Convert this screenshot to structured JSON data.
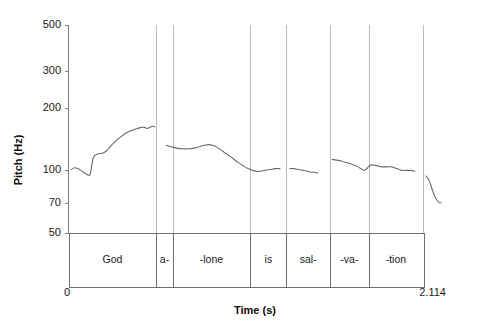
{
  "chart_data": {
    "type": "line",
    "title": "",
    "subtitle": "",
    "xlabel": "Time (s)",
    "ylabel": "Pitch (Hz)",
    "xlim": [
      0,
      2.114
    ],
    "ylim": [
      50,
      500
    ],
    "yscale": "log",
    "xtick_labels": [
      "0",
      "2.114"
    ],
    "ytick_labels": [
      "500",
      "300",
      "200",
      "100",
      "70",
      "50"
    ],
    "ytick_values": [
      500,
      300,
      200,
      100,
      70,
      50
    ],
    "grid": "vertical-segment-boundaries",
    "legend": "none",
    "annotations": [
      "God",
      "a-",
      "-lone",
      "is",
      "sal-",
      "-va-",
      "-tion"
    ],
    "segment_boundaries_s": [
      0.0,
      0.497,
      0.588,
      1.028,
      1.232,
      1.478,
      1.697,
      2.004
    ],
    "series": [
      {
        "name": "God",
        "x": [
          0.016,
          0.034,
          0.053,
          0.07,
          0.086,
          0.1,
          0.112,
          0.123,
          0.14,
          0.165,
          0.19,
          0.214,
          0.24,
          0.268,
          0.3,
          0.33,
          0.36,
          0.39,
          0.412,
          0.43,
          0.446,
          0.46,
          0.474,
          0.488
        ],
        "y": [
          101,
          103,
          102,
          100,
          98,
          96,
          95,
          96,
          115,
          120,
          121,
          124,
          131,
          139,
          146,
          152,
          156,
          159,
          161,
          161,
          159,
          161,
          163,
          162
        ]
      },
      {
        "name": "a- / -lone",
        "x": [
          0.552,
          0.58,
          0.61,
          0.645,
          0.68,
          0.712,
          0.74,
          0.768,
          0.792,
          0.815,
          0.84,
          0.87,
          0.9,
          0.93,
          0.96,
          0.99,
          1.015,
          1.04,
          1.062,
          1.085,
          1.11,
          1.14,
          1.17,
          1.196
        ],
        "y": [
          132,
          130,
          128,
          127,
          127,
          128,
          130,
          132,
          133,
          132,
          129,
          124,
          119,
          114,
          109,
          105,
          102,
          100,
          99,
          99,
          100,
          101,
          102,
          102
        ]
      },
      {
        "name": "is",
        "x": [
          1.252,
          1.275,
          1.3,
          1.325,
          1.35,
          1.372,
          1.392,
          1.408
        ],
        "y": [
          102,
          102,
          101,
          100,
          99,
          98,
          98,
          97
        ]
      },
      {
        "name": "sal- / -va- / -tion",
        "x": [
          1.49,
          1.515,
          1.542,
          1.57,
          1.6,
          1.628,
          1.652,
          1.672,
          1.69,
          1.708,
          1.726,
          1.748,
          1.772,
          1.8,
          1.828,
          1.856,
          1.884,
          1.91,
          1.935,
          1.958
        ],
        "y": [
          113,
          112,
          111,
          109,
          107,
          105,
          102,
          100,
          103,
          106,
          106,
          105,
          104,
          104,
          104,
          102,
          100,
          100,
          100,
          99
        ]
      },
      {
        "name": "-tion tail",
        "x": [
          2.02,
          2.034,
          2.046,
          2.058,
          2.07,
          2.082,
          2.094,
          2.106
        ],
        "y": [
          94,
          91,
          86,
          80,
          75,
          72,
          70,
          70
        ]
      }
    ]
  },
  "axes": {
    "y_title": "Pitch (Hz)",
    "x_title": "Time (s)",
    "y_ticks": [
      {
        "label": "500",
        "value": 500
      },
      {
        "label": "300",
        "value": 300
      },
      {
        "label": "200",
        "value": 200
      },
      {
        "label": "100",
        "value": 100
      },
      {
        "label": "70",
        "value": 70
      },
      {
        "label": "50",
        "value": 50
      }
    ],
    "x_start_label": "0",
    "x_end_label": "2.114"
  },
  "tier": {
    "segments": [
      {
        "label": "God",
        "start": 0.0,
        "end": 0.497
      },
      {
        "label": "a-",
        "start": 0.497,
        "end": 0.588
      },
      {
        "label": "-lone",
        "start": 0.588,
        "end": 1.028
      },
      {
        "label": "is",
        "start": 1.028,
        "end": 1.232
      },
      {
        "label": "sal-",
        "start": 1.232,
        "end": 1.478
      },
      {
        "label": "-va-",
        "start": 1.478,
        "end": 1.697
      },
      {
        "label": "-tion",
        "start": 1.697,
        "end": 2.004
      }
    ]
  },
  "colors": {
    "background": "#ffffff",
    "axis": "#808080",
    "gridline": "#b5b5b5",
    "curve": "#6b6b6b",
    "text": "#1a1a1a",
    "tier_border": "#6e6e6e"
  }
}
